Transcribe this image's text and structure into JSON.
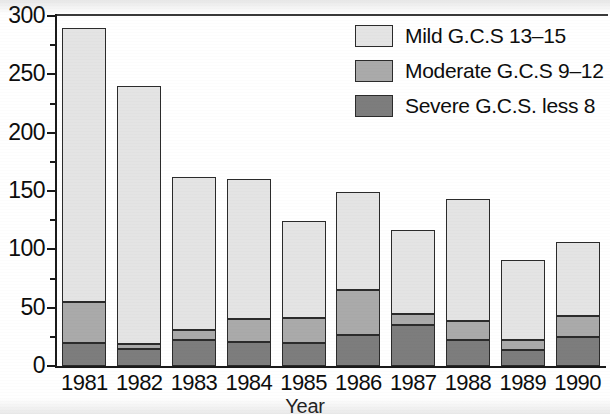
{
  "chart_data": {
    "type": "bar",
    "stacked": true,
    "title": "",
    "xlabel": "Year",
    "ylabel": "",
    "categories": [
      "1981",
      "1982",
      "1983",
      "1984",
      "1985",
      "1986",
      "1987",
      "1988",
      "1989",
      "1990"
    ],
    "series": [
      {
        "name": "Severe G.C.S. less 8",
        "color": "#7d7d7d",
        "values": [
          20,
          15,
          22,
          21,
          20,
          27,
          35,
          22,
          14,
          25
        ]
      },
      {
        "name": "Moderate G.C.S 9–12",
        "color": "#aaaaaa",
        "values": [
          35,
          4,
          9,
          19,
          21,
          38,
          10,
          17,
          8,
          18
        ]
      },
      {
        "name": "Mild G.C.S 13–15",
        "color": "#e4e4e4",
        "values": [
          235,
          221,
          131,
          120,
          83,
          84,
          72,
          104,
          69,
          63
        ]
      }
    ],
    "totals": [
      290,
      240,
      162,
      160,
      124,
      149,
      117,
      143,
      91,
      106
    ],
    "ylim": [
      0,
      300
    ],
    "y_major_ticks": [
      0,
      50,
      100,
      150,
      200,
      250,
      300
    ],
    "y_minor_ticks": [
      25,
      75,
      125,
      175,
      225,
      275
    ],
    "y_tick_labels": [
      "0",
      "50",
      "100",
      "150",
      "200",
      "250",
      "300"
    ],
    "grid": false,
    "legend_position": "top-right",
    "legend_entries": [
      {
        "label": "Mild G.C.S 13–15",
        "color": "#e4e4e4"
      },
      {
        "label": "Moderate G.C.S 9–12",
        "color": "#aaaaaa"
      },
      {
        "label": "Severe G.C.S. less 8",
        "color": "#7d7d7d"
      }
    ]
  },
  "axis": {
    "x_title": "Year"
  }
}
